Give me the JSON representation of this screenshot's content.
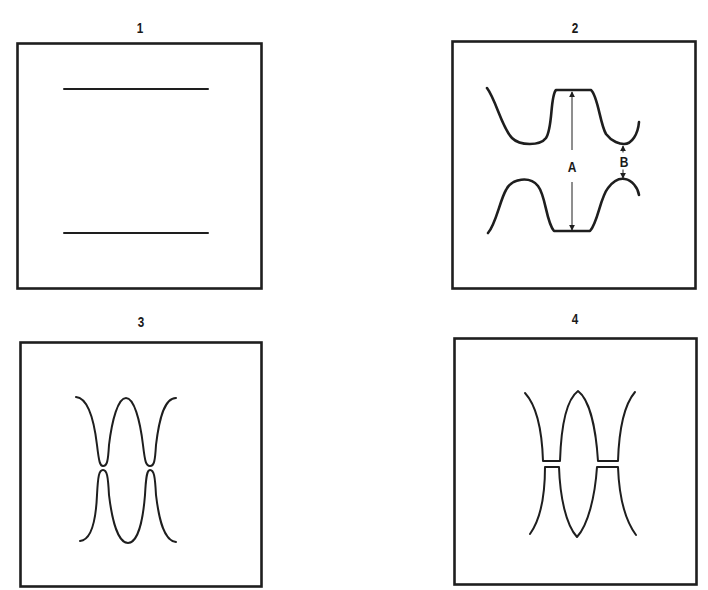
{
  "figure": {
    "panels": [
      {
        "id": 1,
        "label": "1",
        "description": "Two parallel horizontal lines"
      },
      {
        "id": 2,
        "label": "2",
        "description": "Two opposing wavy traces with dimension markers",
        "dimensions": {
          "a_label": "A",
          "b_label": "B"
        }
      },
      {
        "id": 3,
        "label": "3",
        "description": "Two opposing waveforms nearly touching at troughs/peaks"
      },
      {
        "id": 4,
        "label": "4",
        "description": "Two opposing pointed waveforms with flattened clipped tips"
      }
    ],
    "colors": {
      "ink": "#1e1e1e",
      "background": "#ffffff"
    }
  }
}
